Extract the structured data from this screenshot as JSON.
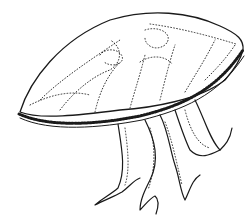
{
  "image": {
    "subject": "jellyfish line drawing",
    "style": "black ink outline with dotted stipple interior",
    "background": "#ffffff",
    "ink": "#1a1a1a"
  }
}
